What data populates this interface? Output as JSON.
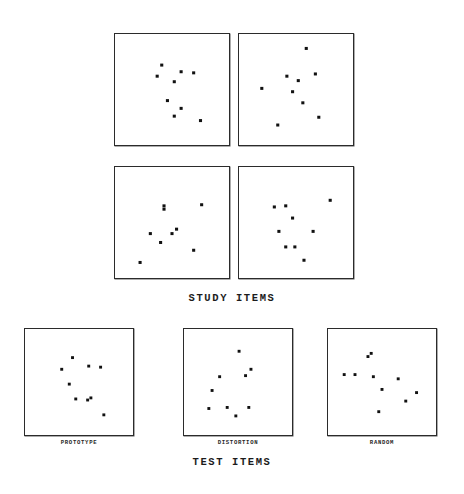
{
  "figure": {
    "study_caption": "STUDY ITEMS",
    "test_caption": "TEST ITEMS"
  },
  "chart_data": {
    "type": "scatter",
    "xlabel": "",
    "ylabel": "",
    "xlim": [
      0,
      100
    ],
    "ylim": [
      0,
      100
    ],
    "grid": false,
    "legend": "none",
    "marker": "filled-square",
    "marker_color": "#111111",
    "panel_border_color": "#2b2b2b",
    "groups": [
      {
        "name": "STUDY ITEMS",
        "caption": "STUDY ITEMS",
        "rows": 2,
        "cols": 2,
        "panels": [
          {
            "index": 0,
            "label": "",
            "n_points": 9,
            "x": [
              41,
              58,
              37,
              52,
              69,
              46,
              58,
              52,
              75
            ],
            "y": [
              72,
              66,
              62,
              57,
              65,
              40,
              33,
              26,
              22
            ]
          },
          {
            "index": 1,
            "label": "",
            "n_points": 9,
            "x": [
              59,
              42,
              52,
              67,
              20,
              47,
              56,
              70,
              34
            ],
            "y": [
              87,
              62,
              58,
              64,
              51,
              48,
              38,
              25,
              18
            ]
          },
          {
            "index": 2,
            "label": "",
            "n_points": 8,
            "x": [
              43,
              43,
              76,
              54,
              31,
              50,
              40,
              69,
              22
            ],
            "y": [
              65,
              62,
              66,
              44,
              40,
              40,
              32,
              25,
              14
            ]
          },
          {
            "index": 3,
            "label": "",
            "n_points": 9,
            "x": [
              31,
              41,
              80,
              47,
              35,
              65,
              41,
              49,
              57
            ],
            "y": [
              64,
              65,
              70,
              54,
              42,
              42,
              28,
              28,
              16
            ]
          }
        ]
      },
      {
        "name": "TEST ITEMS",
        "caption": "TEST ITEMS",
        "rows": 1,
        "cols": 3,
        "panels": [
          {
            "index": 0,
            "label": "PROTOTYPE",
            "n_points": 9,
            "x": [
              44,
              59,
              34,
              70,
              41,
              47,
              58,
              61,
              73
            ],
            "y": [
              73,
              65,
              62,
              64,
              48,
              34,
              33,
              35,
              19
            ]
          },
          {
            "index": 1,
            "label": "DISTORTION",
            "n_points": 9,
            "x": [
              51,
              62,
              33,
              57,
              26,
              40,
              23,
              48,
              60
            ],
            "y": [
              79,
              62,
              55,
              56,
              42,
              26,
              25,
              18,
              26
            ]
          },
          {
            "index": 2,
            "label": "RANDOM",
            "n_points": 10,
            "x": [
              37,
              40,
              15,
              25,
              42,
              65,
              50,
              72,
              47,
              82
            ],
            "y": [
              74,
              77,
              57,
              57,
              55,
              53,
              43,
              32,
              22,
              40
            ]
          }
        ]
      }
    ]
  }
}
